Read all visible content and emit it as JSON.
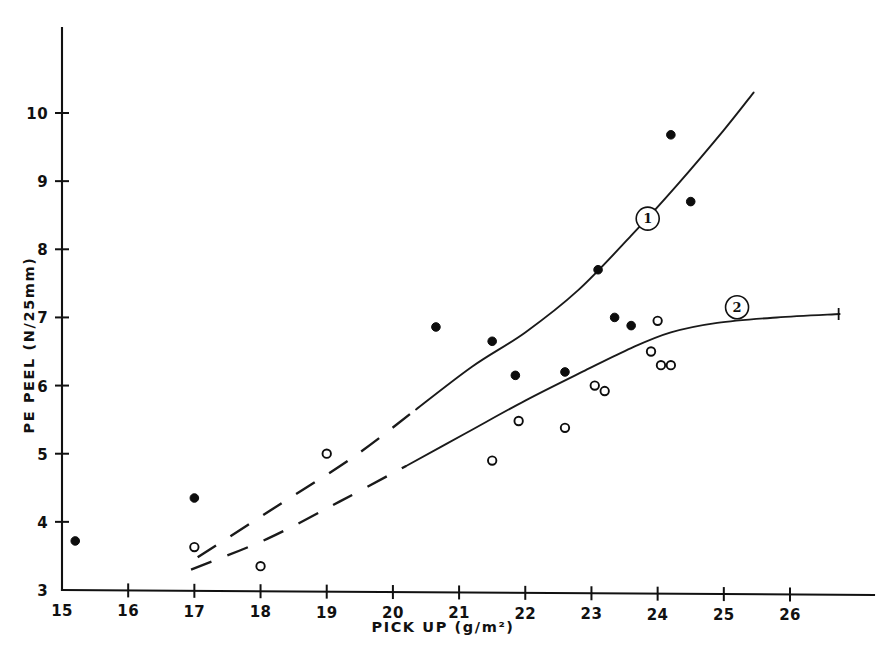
{
  "chart_data": {
    "type": "scatter",
    "title": "",
    "xlabel": "PICK UP (g/m²)",
    "ylabel": "PE PEEL (N/25mm)",
    "xlim": [
      14.6,
      27.1
    ],
    "ylim": [
      3,
      10.95
    ],
    "xticks": [
      15,
      16,
      17,
      18,
      19,
      20,
      21,
      22,
      23,
      24,
      25,
      26
    ],
    "xtick_labels": [
      "15",
      "16",
      "17",
      "18",
      "19",
      "20",
      "21",
      "22",
      "23",
      "24",
      "25",
      "26"
    ],
    "yticks": [
      3,
      4,
      5,
      6,
      7,
      8,
      9,
      10
    ],
    "ytick_labels": [
      "3",
      "4",
      "5",
      "6",
      "7",
      "8",
      "9",
      "10"
    ],
    "grid": false,
    "legend_position": "inline-curve-labels",
    "series": [
      {
        "name": "1",
        "marker": "filled-circle",
        "label": "1",
        "label_x": 23.85,
        "label_y": 8.45,
        "points": [
          {
            "x": 15.2,
            "y": 3.72
          },
          {
            "x": 17.0,
            "y": 4.35
          },
          {
            "x": 20.65,
            "y": 6.86
          },
          {
            "x": 21.5,
            "y": 6.65
          },
          {
            "x": 22.6,
            "y": 6.2
          },
          {
            "x": 23.1,
            "y": 7.7
          },
          {
            "x": 23.35,
            "y": 7.0
          },
          {
            "x": 23.6,
            "y": 6.88
          },
          {
            "x": 24.2,
            "y": 9.68
          },
          {
            "x": 24.5,
            "y": 8.7
          },
          {
            "x": 21.85,
            "y": 6.15
          }
        ]
      },
      {
        "name": "2",
        "marker": "open-circle",
        "label": "2",
        "label_x": 25.2,
        "label_y": 7.15,
        "points": [
          {
            "x": 17.0,
            "y": 3.63
          },
          {
            "x": 18.0,
            "y": 3.35
          },
          {
            "x": 19.0,
            "y": 5.0
          },
          {
            "x": 21.5,
            "y": 4.9
          },
          {
            "x": 21.9,
            "y": 5.48
          },
          {
            "x": 22.6,
            "y": 5.38
          },
          {
            "x": 23.05,
            "y": 6.0
          },
          {
            "x": 23.2,
            "y": 5.92
          },
          {
            "x": 23.9,
            "y": 6.5
          },
          {
            "x": 24.0,
            "y": 6.95
          },
          {
            "x": 24.05,
            "y": 6.3
          },
          {
            "x": 24.2,
            "y": 6.3
          }
        ]
      }
    ],
    "curves": [
      {
        "name": "curve-1",
        "style_dashed_segment": [
          [
            17.05,
            3.48
          ],
          [
            18.2,
            4.2
          ],
          [
            19.4,
            4.95
          ],
          [
            20.35,
            5.65
          ]
        ],
        "style_solid_segment": [
          [
            20.35,
            5.65
          ],
          [
            21.2,
            6.28
          ],
          [
            22.0,
            6.78
          ],
          [
            22.8,
            7.4
          ],
          [
            23.6,
            8.2
          ],
          [
            24.3,
            8.95
          ],
          [
            25.0,
            9.75
          ],
          [
            25.45,
            10.3
          ]
        ]
      },
      {
        "name": "curve-2",
        "style_dashed_segment": [
          [
            16.95,
            3.3
          ],
          [
            18.1,
            3.75
          ],
          [
            19.2,
            4.3
          ],
          [
            20.2,
            4.82
          ]
        ],
        "style_solid_segment": [
          [
            20.2,
            4.82
          ],
          [
            21.1,
            5.3
          ],
          [
            22.0,
            5.78
          ],
          [
            22.9,
            6.22
          ],
          [
            23.6,
            6.55
          ],
          [
            24.2,
            6.78
          ],
          [
            24.9,
            6.92
          ],
          [
            25.8,
            7.0
          ],
          [
            26.75,
            7.05
          ]
        ],
        "end_arrow": true
      }
    ]
  },
  "axis": {
    "x_title": "PICK UP (g/m²)",
    "y_title": "PE PEEL (N/25mm)"
  },
  "colors": {
    "ink": "#111111",
    "background": "#ffffff"
  }
}
